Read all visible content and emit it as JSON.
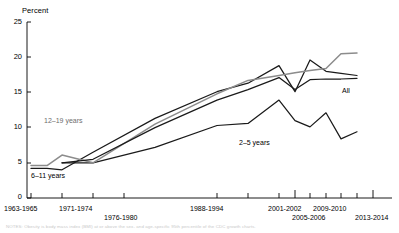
{
  "chart_data": {
    "type": "line",
    "title": "",
    "subtitle": "",
    "xlabel": "",
    "ylabel": "Percent",
    "ylim": [
      0,
      25
    ],
    "yticks": [
      0,
      5,
      10,
      15,
      20,
      25
    ],
    "ytick_labels": [
      "0",
      "5",
      "10",
      "15",
      "20",
      "25"
    ],
    "grid": false,
    "legend_position": "inline-annotations",
    "x": [
      "1963-1965",
      "1966-1970",
      "1971-1974",
      "1976-1980",
      "1988-1994",
      "1999-2000",
      "2001-2002",
      "2003-2004",
      "2005-2006",
      "2007-2008",
      "2009-2010",
      "2011-2012",
      "2013-2014"
    ],
    "xtick_labels": [
      "1963-1965",
      "1971-1974",
      "1976-1980",
      "1988-1994",
      "2001-2002",
      "2005-2006",
      "2009-2010",
      "2013-2014"
    ],
    "series": [
      {
        "name": "2-5 years",
        "label": "2–5 years",
        "color": "#1a1a1a",
        "values": [
          null,
          null,
          5.0,
          5.0,
          7.2,
          10.3,
          10.6,
          13.9,
          11.0,
          10.1,
          12.1,
          8.4,
          9.4
        ]
      },
      {
        "name": "6-11 years",
        "label": "6–11 years",
        "color": "#1a1a1a",
        "values": [
          4.2,
          4.2,
          4.0,
          6.5,
          11.3,
          15.1,
          16.3,
          18.8,
          15.1,
          19.6,
          18.0,
          17.7,
          17.4
        ]
      },
      {
        "name": "12-19 years",
        "label": "12–19 years",
        "color": "#8c8c8c",
        "values": [
          4.6,
          4.6,
          6.1,
          5.0,
          10.5,
          14.8,
          16.7,
          17.4,
          17.8,
          18.1,
          18.4,
          20.5,
          20.6
        ]
      },
      {
        "name": "All",
        "label": "All",
        "color": "#1a1a1a",
        "values": [
          null,
          null,
          5.0,
          5.5,
          10.0,
          13.9,
          15.4,
          17.1,
          15.4,
          16.8,
          16.9,
          16.9,
          17.0
        ]
      }
    ],
    "annotations": [
      {
        "text": "12–19 years",
        "series": "12-19 years",
        "style": "gray"
      },
      {
        "text": "6–11 years",
        "series": "6-11 years",
        "style": "black"
      },
      {
        "text": "2–5 years",
        "series": "2-5 years",
        "style": "black"
      },
      {
        "text": "All",
        "series": "All",
        "style": "black"
      }
    ]
  },
  "axes": {
    "y_title": "Percent"
  },
  "footnote": {
    "text": "NOTES: Obesity is body mass index (BMI) at or above the sex- and age-specific 95th percentile of the CDC growth charts."
  }
}
